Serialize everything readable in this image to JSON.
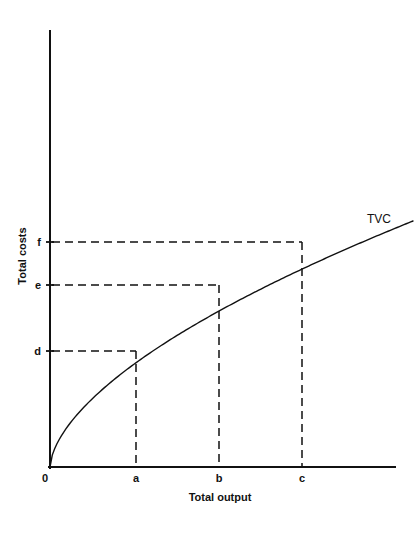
{
  "chart_data": {
    "type": "line",
    "title": "",
    "xlabel": "Total output",
    "ylabel": "Total costs",
    "origin_label": "0",
    "grid": false,
    "legend_position": "curve-end-right",
    "series": [
      {
        "name": "TVC",
        "label": "TVC",
        "description": "Total variable cost curve, concave from origin",
        "points": [
          {
            "x": 0,
            "y": 0
          },
          {
            "x": 136,
            "y": 351
          },
          {
            "x": 219,
            "y": 285
          },
          {
            "x": 302,
            "y": 242
          },
          {
            "x": 363,
            "y": 221
          }
        ]
      }
    ],
    "x_ticks": [
      {
        "label": "a",
        "x": 136
      },
      {
        "label": "b",
        "x": 219
      },
      {
        "label": "c",
        "x": 302
      }
    ],
    "y_ticks": [
      {
        "label": "d",
        "y": 351
      },
      {
        "label": "e",
        "y": 285
      },
      {
        "label": "f",
        "y": 242
      }
    ],
    "annotations": [
      {
        "name": "point-a-d",
        "x_label": "a",
        "y_label": "d"
      },
      {
        "name": "point-b-e",
        "x_label": "b",
        "y_label": "e"
      },
      {
        "name": "point-c-f",
        "x_label": "c",
        "y_label": "f"
      }
    ],
    "xlim": [
      0,
      395
    ],
    "ylim": [
      0,
      467
    ],
    "colors": {
      "ink": "#111111",
      "background": "#ffffff"
    }
  },
  "labels": {
    "y_axis_title": "Total costs",
    "x_axis_title": "Total output",
    "origin": "0",
    "x_a": "a",
    "x_b": "b",
    "x_c": "c",
    "y_d": "d",
    "y_e": "e",
    "y_f": "f",
    "curve": "TVC"
  }
}
